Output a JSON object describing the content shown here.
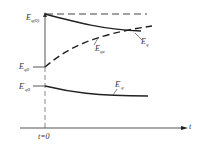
{
  "diagram": {
    "type": "transient-emf-curves",
    "colors": {
      "line": "#222222",
      "label": "#333333",
      "axis": "#555555"
    },
    "axes": {
      "x_label": "t",
      "origin_label": "t=0"
    },
    "labels": {
      "eq0_initial": {
        "base": "E",
        "sub": "q(0)"
      },
      "eq0": {
        "base": "E",
        "sub": "q0"
      },
      "eq0_prime": {
        "base": "E",
        "sub": "q0",
        "sup": "′"
      },
      "eqe": {
        "base": "E",
        "sub": "qe"
      },
      "eq": {
        "base": "E",
        "sub": "q"
      },
      "eq_prime": {
        "base": "E",
        "sub": "q",
        "sup": "′"
      }
    },
    "curves": [
      {
        "name": "Eq(0) reference",
        "style": "dashed",
        "description": "horizontal dashed level at Eq(0)"
      },
      {
        "name": "Eq",
        "style": "solid",
        "description": "decays from Eq(0) toward steady value"
      },
      {
        "name": "Eqe",
        "style": "dashed",
        "description": "rises from Eq0 toward steady value"
      },
      {
        "name": "E'q",
        "style": "solid",
        "description": "decays slowly from E'q0"
      }
    ]
  }
}
